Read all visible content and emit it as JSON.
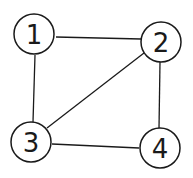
{
  "graph": {
    "nodes": [
      {
        "id": "1",
        "label": "1",
        "x": 34,
        "y": 34,
        "r": 20
      },
      {
        "id": "2",
        "label": "2",
        "x": 161,
        "y": 42,
        "r": 20
      },
      {
        "id": "3",
        "label": "3",
        "x": 31,
        "y": 142,
        "r": 20
      },
      {
        "id": "4",
        "label": "4",
        "x": 160,
        "y": 148,
        "r": 20
      }
    ],
    "edges": [
      {
        "from": "1",
        "to": "2"
      },
      {
        "from": "1",
        "to": "3"
      },
      {
        "from": "2",
        "to": "3"
      },
      {
        "from": "2",
        "to": "4"
      },
      {
        "from": "3",
        "to": "4"
      }
    ]
  }
}
